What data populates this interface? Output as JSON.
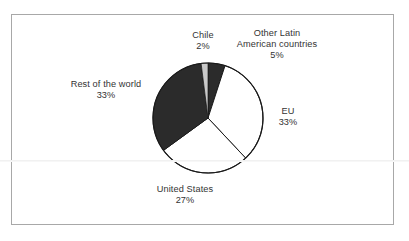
{
  "chart_data": {
    "type": "pie",
    "title": "",
    "subtitle": "",
    "xlabel": "",
    "ylabel": "",
    "legend_position": "none",
    "grid": false,
    "labels_outside": true,
    "start_angle_deg": 0,
    "direction": "clockwise",
    "categories": [
      "Other Latin American countries",
      "EU",
      "United States",
      "Rest of the world",
      "Chile"
    ],
    "values": [
      5,
      33,
      27,
      33,
      2
    ],
    "value_unit": "%",
    "slices": [
      {
        "name": "Other Latin American countries",
        "label": "Other Latin\nAmerican countries",
        "label_line_1": "Other Latin",
        "label_line_2": "American countries",
        "percent": 5,
        "percent_text": "5%",
        "color": "#2b2b2b"
      },
      {
        "name": "EU",
        "label": "EU",
        "label_line_1": "EU",
        "label_line_2": "",
        "percent": 33,
        "percent_text": "33%",
        "color": "#ffffff"
      },
      {
        "name": "United States",
        "label": "United States",
        "label_line_1": "United States",
        "label_line_2": "",
        "percent": 27,
        "percent_text": "27%",
        "color": "#ffffff"
      },
      {
        "name": "Rest of the world",
        "label": "Rest of the world",
        "label_line_1": "Rest of the world",
        "label_line_2": "",
        "percent": 33,
        "percent_text": "33%",
        "color": "#2b2b2b"
      },
      {
        "name": "Chile",
        "label": "Chile",
        "label_line_1": "Chile",
        "label_line_2": "",
        "percent": 2,
        "percent_text": "2%",
        "color": "#c9c9c9"
      }
    ]
  },
  "figure": {
    "frame_color": "#a8a8a8",
    "background_color": "#ffffff",
    "outline_color": "#1a1a1a",
    "text_color": "#333333",
    "center_x": 208,
    "center_y": 118,
    "radius": 55
  },
  "labels": {
    "chile": {
      "name": "Chile",
      "percent_text": "2%"
    },
    "other_latin": {
      "line1": "Other Latin",
      "line2": "American countries",
      "percent_text": "5%"
    },
    "eu": {
      "name": "EU",
      "percent_text": "33%"
    },
    "united_states": {
      "name": "United States",
      "percent_text": "27%"
    },
    "rest_of_world": {
      "name": "Rest of the world",
      "percent_text": "33%"
    }
  }
}
